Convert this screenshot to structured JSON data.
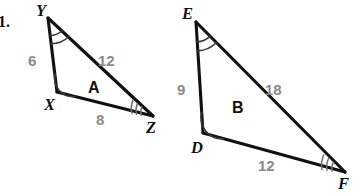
{
  "figure": {
    "problem_number": "1.",
    "background_color": "#ffffff",
    "stroke_color": "#111111",
    "label_color": "#8a8a8a",
    "angle_mark_color": "#6f6f6f"
  },
  "triangles": [
    {
      "name": "A",
      "name_label": "A",
      "name_pos": {
        "x": 88,
        "y": 80
      },
      "vertices": [
        {
          "id": "Y",
          "label": "Y",
          "x": 48,
          "y": 18,
          "label_pos": {
            "x": 36,
            "y": 3
          },
          "angle_mark": "double-arc"
        },
        {
          "id": "X",
          "label": "X",
          "x": 57,
          "y": 92,
          "label_pos": {
            "x": 44,
            "y": 97
          },
          "angle_mark": "single-arc"
        },
        {
          "id": "Z",
          "label": "Z",
          "x": 153,
          "y": 116,
          "label_pos": {
            "x": 146,
            "y": 120
          },
          "angle_mark": "triple-tick"
        }
      ],
      "sides": [
        {
          "from": "Y",
          "to": "X",
          "length": "6",
          "label_pos": {
            "x": 28,
            "y": 53
          }
        },
        {
          "from": "Y",
          "to": "Z",
          "length": "12",
          "label_pos": {
            "x": 98,
            "y": 53
          }
        },
        {
          "from": "X",
          "to": "Z",
          "length": "8",
          "label_pos": {
            "x": 96,
            "y": 112
          }
        }
      ]
    },
    {
      "name": "B",
      "name_label": "B",
      "name_pos": {
        "x": 232,
        "y": 100
      },
      "vertices": [
        {
          "id": "E",
          "label": "E",
          "x": 196,
          "y": 22,
          "label_pos": {
            "x": 182,
            "y": 6
          },
          "angle_mark": "double-arc"
        },
        {
          "id": "D",
          "label": "D",
          "x": 203,
          "y": 133,
          "label_pos": {
            "x": 191,
            "y": 140
          },
          "angle_mark": "single-arc"
        },
        {
          "id": "F",
          "label": "F",
          "x": 345,
          "y": 172,
          "label_pos": {
            "x": 338,
            "y": 176
          },
          "angle_mark": "triple-tick"
        }
      ],
      "sides": [
        {
          "from": "E",
          "to": "D",
          "length": "9",
          "label_pos": {
            "x": 177,
            "y": 82
          }
        },
        {
          "from": "E",
          "to": "F",
          "length": "18",
          "label_pos": {
            "x": 265,
            "y": 82
          }
        },
        {
          "from": "D",
          "to": "F",
          "length": "12",
          "label_pos": {
            "x": 258,
            "y": 158
          }
        }
      ]
    }
  ]
}
